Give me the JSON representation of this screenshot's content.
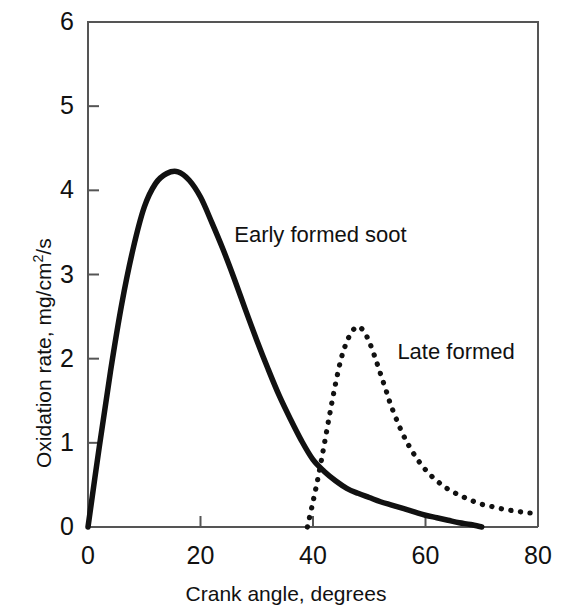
{
  "chart_data": {
    "type": "line",
    "title": "",
    "xlabel": "Crank angle, degrees",
    "ylabel": "Oxidation rate, mg/cm2/s",
    "ylabel_parts": {
      "pre": "Oxidation rate, mg/cm",
      "sup": "2",
      "post": "/s"
    },
    "xlim": [
      0,
      80
    ],
    "ylim": [
      0,
      6
    ],
    "xticks": [
      0,
      20,
      40,
      60,
      80
    ],
    "xtick_labels": [
      "0",
      "20",
      "40",
      "60",
      "80"
    ],
    "yticks": [
      0,
      1,
      2,
      3,
      4,
      5,
      6
    ],
    "ytick_labels": [
      "0",
      "1",
      "2",
      "3",
      "4",
      "5",
      "6"
    ],
    "grid": false,
    "legend_position": "inline-annotation",
    "annotations": [
      {
        "text": "Early formed soot",
        "x": 26,
        "y": 3.45
      },
      {
        "text": "Late formed",
        "x": 55,
        "y": 2.05
      }
    ],
    "series": [
      {
        "name": "Early formed soot",
        "style": "solid",
        "color": "#111111",
        "peak_x": 16,
        "peak_y": 4.22,
        "x": [
          0,
          2,
          4,
          6,
          8,
          10,
          12,
          14,
          16,
          18,
          20,
          22,
          24,
          26,
          28,
          30,
          32,
          34,
          36,
          38,
          40,
          42,
          44,
          46,
          48,
          50,
          52,
          54,
          56,
          58,
          60,
          62,
          64,
          66,
          68,
          70
        ],
        "y": [
          0,
          0.95,
          1.85,
          2.65,
          3.3,
          3.8,
          4.08,
          4.2,
          4.22,
          4.12,
          3.92,
          3.62,
          3.3,
          2.95,
          2.58,
          2.22,
          1.88,
          1.56,
          1.28,
          1.02,
          0.8,
          0.66,
          0.55,
          0.46,
          0.4,
          0.35,
          0.3,
          0.26,
          0.22,
          0.18,
          0.14,
          0.11,
          0.08,
          0.05,
          0.03,
          0.0
        ]
      },
      {
        "name": "Late formed",
        "style": "dotted",
        "color": "#111111",
        "peak_x": 48,
        "peak_y": 2.38,
        "x": [
          39,
          40,
          41,
          42,
          43,
          44,
          45,
          46,
          47,
          48,
          49,
          50,
          51,
          52,
          53,
          54,
          56,
          58,
          60,
          62,
          64,
          66,
          68,
          70,
          72,
          74,
          76,
          78,
          80
        ],
        "y": [
          0,
          0.3,
          0.62,
          0.98,
          1.35,
          1.7,
          2.0,
          2.2,
          2.33,
          2.38,
          2.33,
          2.2,
          2.02,
          1.82,
          1.62,
          1.42,
          1.1,
          0.86,
          0.68,
          0.55,
          0.45,
          0.38,
          0.32,
          0.27,
          0.24,
          0.21,
          0.19,
          0.17,
          0.16
        ]
      }
    ]
  },
  "axes": {
    "x_title": "Crank angle, degrees",
    "y_title": "Oxidation rate, mg/cm2/s"
  }
}
